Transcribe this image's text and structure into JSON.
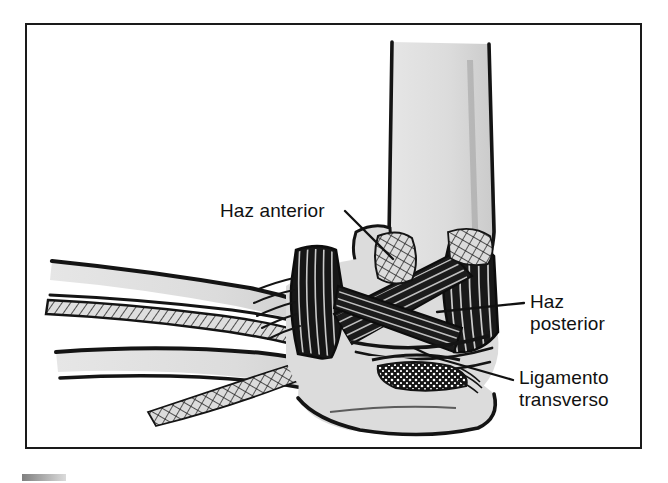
{
  "figure": {
    "kind": "anatomical-illustration",
    "language": "es",
    "frame": {
      "border_color": "#1a1a1a",
      "background": "#ffffff"
    },
    "palette": {
      "ink": "#111111",
      "bone_fill": "#dedede",
      "bone_shadow": "#c4c4c4",
      "ligament_dark": "#121212",
      "paper": "#ffffff"
    }
  },
  "labels": [
    {
      "id": "haz-anterior",
      "text": "Haz anterior",
      "lines": [
        "Haz anterior"
      ],
      "x": 220,
      "y": 200,
      "leader": {
        "from_x": 345,
        "from_y": 212,
        "to_x": 392,
        "to_y": 258
      }
    },
    {
      "id": "haz-posterior",
      "text": "Haz posterior",
      "lines": [
        "Haz",
        "posterior"
      ],
      "line1": "Haz",
      "line2": "posterior",
      "x": 530,
      "y": 291,
      "leader": {
        "from_x": 524,
        "from_y": 303,
        "to_x": 440,
        "to_y": 312
      }
    },
    {
      "id": "ligamento-transverso",
      "text": "Ligamento transverso",
      "lines": [
        "Ligamento",
        "transverso"
      ],
      "line1": "Ligamento",
      "line2": "transverso",
      "x": 519,
      "y": 367,
      "leader": {
        "from_x": 513,
        "from_y": 380,
        "to_x": 432,
        "to_y": 358
      }
    }
  ],
  "structures": [
    {
      "id": "humerus-shaft",
      "name": "Húmero"
    },
    {
      "id": "medial-epicondyle",
      "name": "Epicóndilo medial"
    },
    {
      "id": "ulna",
      "name": "Cúbito"
    },
    {
      "id": "radius",
      "name": "Radio"
    },
    {
      "id": "olecranon",
      "name": "Olécranon"
    },
    {
      "id": "anterior-bundle",
      "name": "Haz anterior"
    },
    {
      "id": "posterior-bundle",
      "name": "Haz posterior"
    },
    {
      "id": "transverse-ligament",
      "name": "Ligamento transverso"
    }
  ]
}
